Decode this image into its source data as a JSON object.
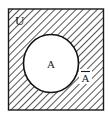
{
  "figure": {
    "type": "venn-diagram",
    "background_color": "#ffffff",
    "line_color": "#1a1a1a",
    "fill_color": "#ffffff",
    "hatch_color": "#2b2b2b"
  },
  "universal_set": {
    "label": "U",
    "shape": "rectangle",
    "label_position": "top-left-inside",
    "fill": "hatched-diagonal"
  },
  "set_a": {
    "label": "A",
    "shape": "ellipse",
    "label_position": "center",
    "fill": "white"
  },
  "complement": {
    "label": "A",
    "overbar": true,
    "notation": "Ā",
    "label_position": "lower-right-inside",
    "region": "U minus A"
  },
  "hatching": {
    "direction": "backslash",
    "angle_degrees": 45,
    "spacing_px": 4,
    "stroke_width_px": 1.1
  }
}
